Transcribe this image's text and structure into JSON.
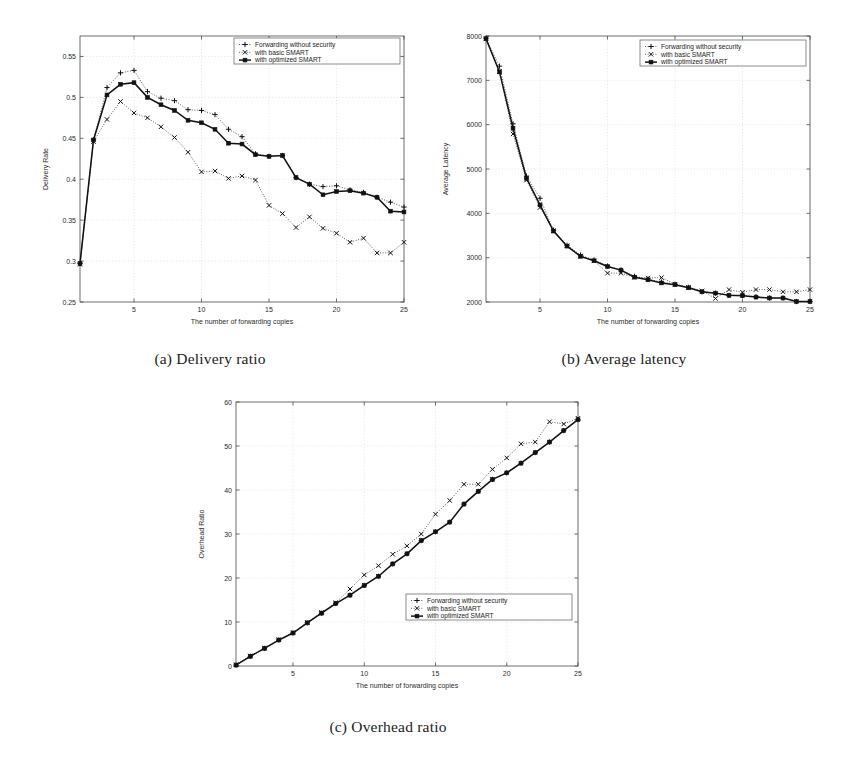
{
  "document": {
    "kind": "figure-page",
    "background": "#ffffff"
  },
  "legend_labels": {
    "plain": "Forwarding without security",
    "basic": "with basic SMART",
    "optimized": "with optimized SMART"
  },
  "captions": {
    "a": "(a) Delivery ratio",
    "b": "(b) Average latency",
    "c": "(c) Overhead ratio"
  },
  "xaxis_title": "The number of forwarding copies",
  "chart_data": [
    {
      "id": "a",
      "type": "line",
      "title": "",
      "xlabel": "The number of forwarding copies",
      "ylabel": "Delivery Rate",
      "xlim": [
        1,
        25
      ],
      "ylim": [
        0.25,
        0.575
      ],
      "xticks": [
        5,
        10,
        15,
        20,
        25
      ],
      "yticks": [
        0.25,
        0.3,
        0.35,
        0.4,
        0.45,
        0.5,
        0.55
      ],
      "ytick_labels": [
        "0.25",
        "0.3",
        "0.35",
        "0.4",
        "0.45",
        "0.5",
        "0.55"
      ],
      "grid": true,
      "legend_position": "top-right",
      "x": [
        1,
        2,
        3,
        4,
        5,
        6,
        7,
        8,
        9,
        10,
        11,
        12,
        13,
        14,
        15,
        16,
        17,
        18,
        19,
        20,
        21,
        22,
        23,
        24,
        25
      ],
      "series": [
        {
          "name": "Forwarding without security",
          "marker": "plus",
          "linestyle": "dotted",
          "values": [
            0.297,
            0.448,
            0.512,
            0.53,
            0.533,
            0.507,
            0.499,
            0.496,
            0.485,
            0.484,
            0.479,
            0.461,
            0.452,
            0.431,
            0.428,
            0.429,
            0.402,
            0.394,
            0.391,
            0.392,
            0.387,
            0.384,
            0.378,
            0.372,
            0.366
          ]
        },
        {
          "name": "with basic SMART",
          "marker": "cross",
          "linestyle": "dotted",
          "values": [
            0.296,
            0.446,
            0.473,
            0.495,
            0.481,
            0.475,
            0.464,
            0.451,
            0.433,
            0.409,
            0.41,
            0.401,
            0.404,
            0.399,
            0.368,
            0.358,
            0.341,
            0.354,
            0.34,
            0.334,
            0.323,
            0.328,
            0.31,
            0.31,
            0.323
          ]
        },
        {
          "name": "with optimized SMART",
          "marker": "square",
          "linestyle": "solid",
          "values": [
            0.297,
            0.448,
            0.503,
            0.516,
            0.518,
            0.5,
            0.491,
            0.484,
            0.472,
            0.469,
            0.461,
            0.444,
            0.443,
            0.43,
            0.428,
            0.429,
            0.402,
            0.394,
            0.381,
            0.385,
            0.386,
            0.383,
            0.378,
            0.361,
            0.36
          ]
        }
      ]
    },
    {
      "id": "b",
      "type": "line",
      "title": "",
      "xlabel": "The number of forwarding copies",
      "ylabel": "Average Latency",
      "xlim": [
        1,
        25
      ],
      "ylim": [
        2000,
        8000
      ],
      "xticks": [
        5,
        10,
        15,
        20,
        25
      ],
      "yticks": [
        2000,
        3000,
        4000,
        5000,
        6000,
        7000,
        8000
      ],
      "ytick_labels": [
        "2000",
        "3000",
        "4000",
        "5000",
        "6000",
        "7000",
        "8000"
      ],
      "grid": true,
      "legend_position": "top-right",
      "x": [
        1,
        2,
        3,
        4,
        5,
        6,
        7,
        8,
        9,
        10,
        11,
        12,
        13,
        14,
        15,
        16,
        17,
        18,
        19,
        20,
        21,
        22,
        23,
        24,
        25
      ],
      "series": [
        {
          "name": "Forwarding without security",
          "marker": "plus",
          "linestyle": "dotted",
          "values": [
            7950,
            7320,
            6020,
            4840,
            4340,
            3620,
            3280,
            3060,
            2950,
            2810,
            2720,
            2580,
            2520,
            2450,
            2400,
            2330,
            2230,
            2200,
            2150,
            2150,
            2120,
            2090,
            2090,
            2010,
            2010
          ]
        },
        {
          "name": "with basic SMART",
          "marker": "cross",
          "linestyle": "dotted",
          "values": [
            7940,
            7200,
            5790,
            4750,
            4130,
            3610,
            3270,
            3040,
            2930,
            2650,
            2650,
            2560,
            2540,
            2550,
            2400,
            2330,
            2250,
            2080,
            2280,
            2220,
            2280,
            2280,
            2230,
            2230,
            2280
          ]
        },
        {
          "name": "with optimized SMART",
          "marker": "square",
          "linestyle": "solid",
          "values": [
            7940,
            7190,
            5920,
            4790,
            4190,
            3600,
            3260,
            3030,
            2930,
            2800,
            2720,
            2560,
            2500,
            2430,
            2390,
            2320,
            2230,
            2200,
            2150,
            2140,
            2110,
            2090,
            2090,
            2010,
            2010
          ]
        }
      ]
    },
    {
      "id": "c",
      "type": "line",
      "title": "",
      "xlabel": "The number of forwarding copies",
      "ylabel": "Overhead Ratio",
      "xlim": [
        1,
        25
      ],
      "ylim": [
        0,
        60
      ],
      "xticks": [
        5,
        10,
        15,
        20,
        25
      ],
      "yticks": [
        0,
        10,
        20,
        30,
        40,
        50,
        60
      ],
      "ytick_labels": [
        "0",
        "10",
        "20",
        "30",
        "40",
        "50",
        "60"
      ],
      "grid": true,
      "legend_position": "bottom-right",
      "x": [
        1,
        2,
        3,
        4,
        5,
        6,
        7,
        8,
        9,
        10,
        11,
        12,
        13,
        14,
        15,
        16,
        17,
        18,
        19,
        20,
        21,
        22,
        23,
        24,
        25
      ],
      "series": [
        {
          "name": "Forwarding without security",
          "marker": "plus",
          "linestyle": "dotted",
          "values": [
            0.2,
            2.2,
            4.0,
            5.9,
            7.5,
            9.8,
            12.0,
            14.2,
            16.1,
            18.3,
            20.4,
            23.2,
            25.5,
            28.5,
            30.5,
            32.7,
            36.8,
            39.7,
            42.4,
            43.9,
            46.1,
            48.5,
            50.9,
            53.5,
            56.0
          ]
        },
        {
          "name": "with basic SMART",
          "marker": "cross",
          "linestyle": "dotted",
          "values": [
            0.3,
            2.3,
            4.1,
            6.0,
            7.6,
            9.9,
            12.2,
            14.4,
            17.5,
            20.7,
            22.8,
            25.4,
            27.3,
            30.0,
            34.5,
            37.6,
            41.3,
            41.3,
            44.7,
            47.3,
            50.5,
            50.9,
            55.5,
            55.0,
            56.3
          ]
        },
        {
          "name": "with optimized SMART",
          "marker": "square",
          "linestyle": "solid",
          "values": [
            0.2,
            2.2,
            4.0,
            5.9,
            7.5,
            9.8,
            12.0,
            14.2,
            16.1,
            18.3,
            20.4,
            23.2,
            25.5,
            28.5,
            30.5,
            32.7,
            36.8,
            39.7,
            42.4,
            43.9,
            46.1,
            48.5,
            50.9,
            53.5,
            56.0
          ]
        }
      ]
    }
  ]
}
